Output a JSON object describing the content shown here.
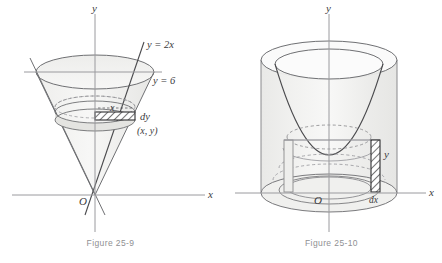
{
  "figures": [
    {
      "id": "figure-25-9",
      "caption": "Figure 25-9",
      "subject": "cone-disk-element",
      "axis_labels": {
        "y": "y",
        "x": "x",
        "origin": "O"
      },
      "annotations": {
        "line_slope": "y = 2x",
        "line_horizontal": "y = 6",
        "radius": "x",
        "thickness": "dy",
        "point": "(x, y)"
      },
      "colors": {
        "stroke": "#6f7073",
        "stroke_dark": "#4a4a4d",
        "axis": "#9a9a9e",
        "fill_light": "#f3f3f2",
        "fill_mid": "#e8e8e6",
        "hatch": "#3a3a3c",
        "caption": "#8f9093"
      }
    },
    {
      "id": "figure-25-10",
      "caption": "Figure 25-10",
      "subject": "paraboloid-shell-element",
      "axis_labels": {
        "y": "y",
        "x": "x",
        "origin": "O"
      },
      "annotations": {
        "height": "y",
        "thickness": "dx"
      },
      "colors": {
        "stroke": "#6f7073",
        "stroke_dark": "#4a4a4d",
        "axis": "#9a9a9e",
        "fill_light": "#f5f5f4",
        "fill_mid": "#e9e9e7",
        "hatch": "#3a3a3c",
        "caption": "#8f9093"
      }
    }
  ]
}
